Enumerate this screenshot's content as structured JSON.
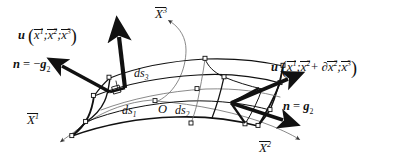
{
  "figure": {
    "background_color": "#ffffff",
    "ink_color": "#111111",
    "thin_line_color": "#6b6b6b"
  },
  "axes": [
    {
      "id": "x3",
      "name": "X3-axis-label",
      "base": "X",
      "superscript": "3",
      "overline": true,
      "description": "third curvilinear coordinate axis, upper area"
    },
    {
      "id": "x1",
      "name": "X1-axis-label",
      "base": "X",
      "superscript": "1",
      "overline": true,
      "description": "first curvilinear coordinate axis, lower left"
    },
    {
      "id": "x2",
      "name": "X2-axis-label",
      "base": "X",
      "superscript": "2",
      "overline": true,
      "description": "second curvilinear coordinate axis, lower right"
    }
  ],
  "vectors": {
    "u_left": {
      "symbol": "u",
      "args": [
        {
          "base": "x",
          "superscript": "1",
          "overline": true
        },
        {
          "base": "x",
          "superscript": "2",
          "overline": true
        },
        {
          "base": "x",
          "superscript": "3",
          "overline": true
        }
      ],
      "separator": ";",
      "open_paren": "(",
      "close_paren": ")",
      "description": "displacement vector at the left face"
    },
    "u_right": {
      "symbol": "u",
      "args": [
        {
          "base": "x",
          "superscript": "1",
          "overline": true
        },
        {
          "base": "x",
          "superscript": "2",
          "overline": true,
          "increment": "+ ∂",
          "increment_base": "x",
          "increment_superscript": "2"
        },
        {
          "base": "x",
          "superscript": "3",
          "overline": true
        }
      ],
      "separator": ";",
      "open_paren": "(",
      "close_paren": ")",
      "description": "displacement vector at the right face, incremented in x2"
    },
    "n_left": {
      "lhs": "n",
      "equals": "=",
      "sign": "−",
      "rhs_symbol": "g",
      "rhs_subscript": "2",
      "description": "outward unit normal on the left face, equal to minus g2"
    },
    "n_right": {
      "lhs": "n",
      "equals": "=",
      "sign": "",
      "rhs_symbol": "g",
      "rhs_subscript": "2",
      "description": "outward unit normal on the right face, equal to g2"
    }
  },
  "arc_lengths": [
    {
      "id": "ds1",
      "base": "ds",
      "subscript": "1",
      "description": "arc length along X1"
    },
    {
      "id": "ds2",
      "base": "ds",
      "subscript": "2",
      "description": "arc length along X2"
    },
    {
      "id": "ds3",
      "base": "ds",
      "subscript": "3",
      "description": "arc length along X3"
    }
  ],
  "origin": {
    "label": "O",
    "description": "origin / centre point of the volume element"
  }
}
